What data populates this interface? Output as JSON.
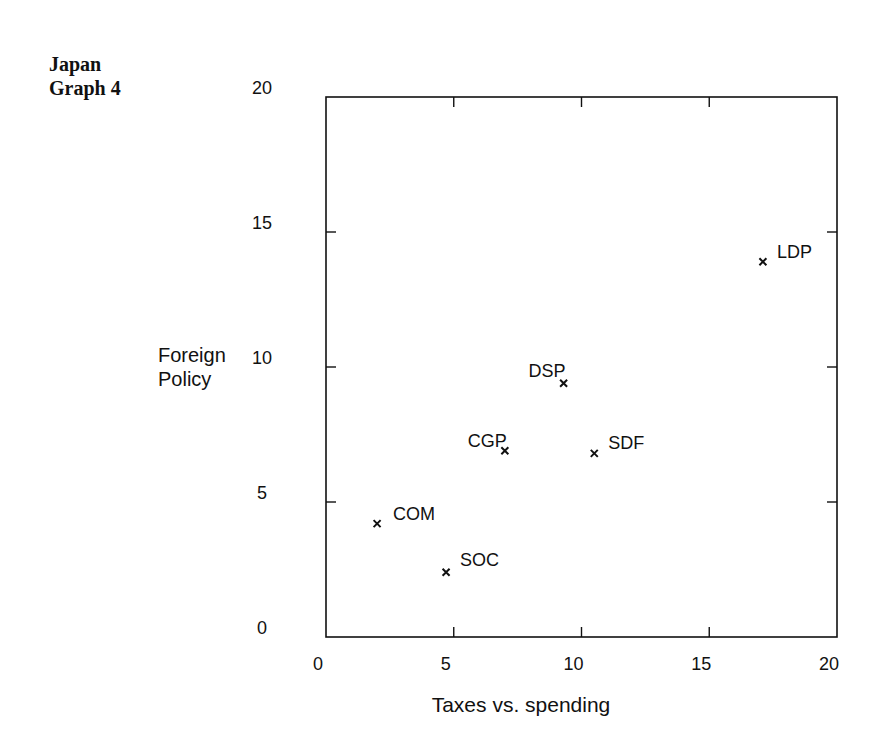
{
  "header": {
    "line1": "Japan",
    "line2": "Graph 4"
  },
  "chart_data": {
    "type": "scatter",
    "title": "Japan Graph 4",
    "xlabel": "Taxes vs. spending",
    "ylabel": "Foreign Policy",
    "xlim": [
      0,
      20
    ],
    "ylim": [
      0,
      20
    ],
    "xticks": [
      0,
      5,
      10,
      15,
      20
    ],
    "yticks": [
      0,
      5,
      10,
      15,
      20
    ],
    "grid": false,
    "legend": null,
    "marker": "x",
    "points": [
      {
        "label": "COM",
        "x": 2.0,
        "y": 4.2
      },
      {
        "label": "SOC",
        "x": 4.7,
        "y": 2.4
      },
      {
        "label": "CGP",
        "x": 7.0,
        "y": 6.9
      },
      {
        "label": "DSP",
        "x": 9.3,
        "y": 9.4
      },
      {
        "label": "SDF",
        "x": 10.5,
        "y": 6.8
      },
      {
        "label": "LDP",
        "x": 17.1,
        "y": 13.9
      }
    ]
  }
}
